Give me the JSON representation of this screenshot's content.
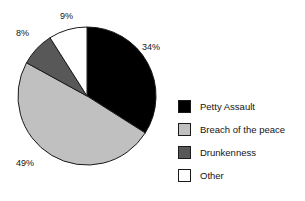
{
  "chart_data": {
    "type": "pie",
    "title": "",
    "categories": [
      "Petty Assault",
      "Breach of the peace",
      "Drunkenness",
      "Other"
    ],
    "values": [
      34,
      49,
      8,
      9
    ],
    "value_labels": [
      "34%",
      "49%",
      "8%",
      "9%"
    ],
    "colors": [
      "#000000",
      "#c0c0c0",
      "#585858",
      "#ffffff"
    ],
    "units": "percent",
    "start_angle_deg": 0,
    "direction": "clockwise",
    "legend_position": "right",
    "grid": false,
    "xlabel": "",
    "ylabel": ""
  },
  "labels": {
    "petty": "34%",
    "breach": "49%",
    "drunkenness": "8%",
    "other": "9%"
  },
  "legend": {
    "items": [
      {
        "label": "Petty Assault",
        "color": "#000000"
      },
      {
        "label": "Breach of the peace",
        "color": "#c0c0c0"
      },
      {
        "label": "Drunkenness",
        "color": "#585858"
      },
      {
        "label": "Other",
        "color": "#ffffff"
      }
    ]
  },
  "geometry": {
    "center_x": 87,
    "center_y": 96,
    "radius": 69
  }
}
